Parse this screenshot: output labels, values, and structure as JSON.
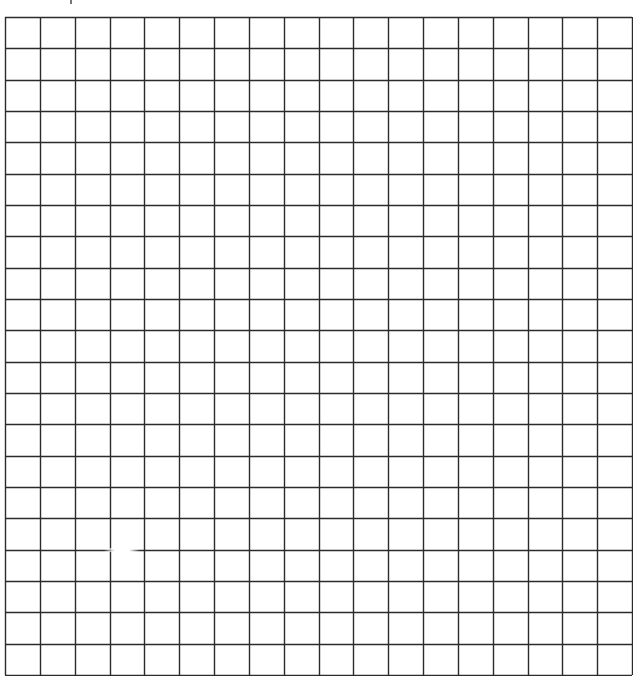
{
  "grid": {
    "columns": 18,
    "rows": 21,
    "left": 4,
    "top": 16,
    "width": 627,
    "height": 658,
    "line_color": "#2b2b2b",
    "background": "#ffffff",
    "line_width": 1.4
  },
  "artifacts": {
    "line_gap": {
      "row_line_index": 17,
      "x_start": 104,
      "x_end": 140
    }
  }
}
